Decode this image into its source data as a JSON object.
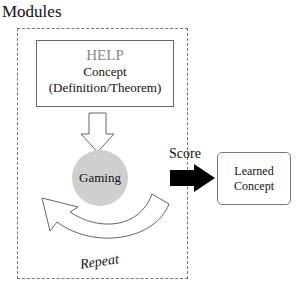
{
  "diagram": {
    "container_title": "Modules",
    "help_box": {
      "title": "HELP",
      "lines": [
        "Concept",
        "(Definition/Theorem)"
      ]
    },
    "gaming_node": {
      "label": "Gaming",
      "fill": "#cfcfcf"
    },
    "score_label": "Score",
    "learned_box": {
      "lines": [
        "Learned",
        "Concept"
      ]
    },
    "repeat_label": "Repeat",
    "colors": {
      "dashed_border": "#777777",
      "help_title": "#888888",
      "score_arrow": "#000000"
    }
  }
}
